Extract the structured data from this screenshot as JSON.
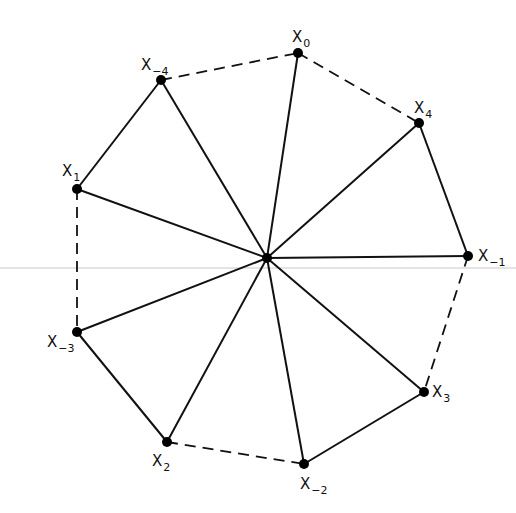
{
  "diagram": {
    "center": {
      "id": "O",
      "x": 267,
      "y": 258
    },
    "vertices": [
      {
        "id": "x0",
        "base": "X",
        "sub": "0",
        "x": 298,
        "y": 53,
        "lx": 292,
        "ly": 42
      },
      {
        "id": "x4",
        "base": "X",
        "sub": "4",
        "x": 419,
        "y": 123,
        "lx": 414,
        "ly": 113
      },
      {
        "id": "xm1",
        "base": "X",
        "sub": "−1",
        "x": 468,
        "y": 256,
        "lx": 478,
        "ly": 261
      },
      {
        "id": "x3",
        "base": "X",
        "sub": "3",
        "x": 424,
        "y": 392,
        "lx": 432,
        "ly": 397
      },
      {
        "id": "xm2",
        "base": "X",
        "sub": "−2",
        "x": 304,
        "y": 464,
        "lx": 300,
        "ly": 489
      },
      {
        "id": "x2",
        "base": "X",
        "sub": "2",
        "x": 167,
        "y": 442,
        "lx": 152,
        "ly": 466
      },
      {
        "id": "xm3",
        "base": "X",
        "sub": "−3",
        "x": 77,
        "y": 332,
        "lx": 47,
        "ly": 347
      },
      {
        "id": "x1",
        "base": "X",
        "sub": "1",
        "x": 77,
        "y": 189,
        "lx": 62,
        "ly": 176
      },
      {
        "id": "xm4",
        "base": "X",
        "sub": "−4",
        "x": 161,
        "y": 80,
        "lx": 141,
        "ly": 70
      }
    ],
    "solid_edges": [
      [
        "xm4",
        "x1"
      ],
      [
        "x4",
        "xm1"
      ],
      [
        "xm3",
        "x2"
      ],
      [
        "xm2",
        "x3"
      ]
    ],
    "dashed_edges": [
      [
        "xm4",
        "x0"
      ],
      [
        "x0",
        "x4"
      ],
      [
        "x1",
        "xm3"
      ],
      [
        "xm1",
        "x3"
      ],
      [
        "x2",
        "xm2"
      ]
    ],
    "spokes": "center-to-all-vertices",
    "guide_line": {
      "y": 268,
      "color": "#c8c8c8"
    },
    "colors": {
      "line": "#111111",
      "point": "#000000",
      "background": "#ffffff"
    }
  }
}
